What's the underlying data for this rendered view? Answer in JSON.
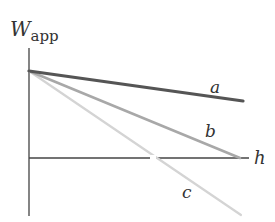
{
  "diagram": {
    "y_axis_label": {
      "main": "W",
      "sub": "app"
    },
    "x_axis_label": "h",
    "lines": [
      {
        "label": "a",
        "color": "#555555",
        "width": 3.2,
        "x1": 29,
        "y1": 71,
        "x2": 243,
        "y2": 101,
        "label_x": 210,
        "label_y": 93
      },
      {
        "label": "b",
        "color": "#a8a8a8",
        "width": 2.6,
        "x1": 29,
        "y1": 71,
        "x2": 240,
        "y2": 158,
        "label_x": 205,
        "label_y": 137
      },
      {
        "label": "c",
        "color": "#d4d4d4",
        "width": 2.2,
        "x1": 29,
        "y1": 71,
        "x2": 241,
        "y2": 215,
        "label_x": 182,
        "label_y": 198
      }
    ],
    "axes_color": "#555555"
  }
}
